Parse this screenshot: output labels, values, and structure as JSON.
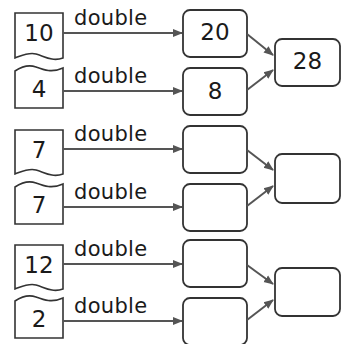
{
  "operation_label": "double",
  "colors": {
    "box_stroke": "#333333",
    "arrow": "#555555",
    "text": "#1a1a1a"
  },
  "groups": [
    {
      "inputs": [
        "10",
        "4"
      ],
      "doubled": [
        "20",
        "8"
      ],
      "sum": "28"
    },
    {
      "inputs": [
        "7",
        "7"
      ],
      "doubled": [
        "",
        ""
      ],
      "sum": ""
    },
    {
      "inputs": [
        "12",
        "2"
      ],
      "doubled": [
        "",
        ""
      ],
      "sum": ""
    }
  ]
}
